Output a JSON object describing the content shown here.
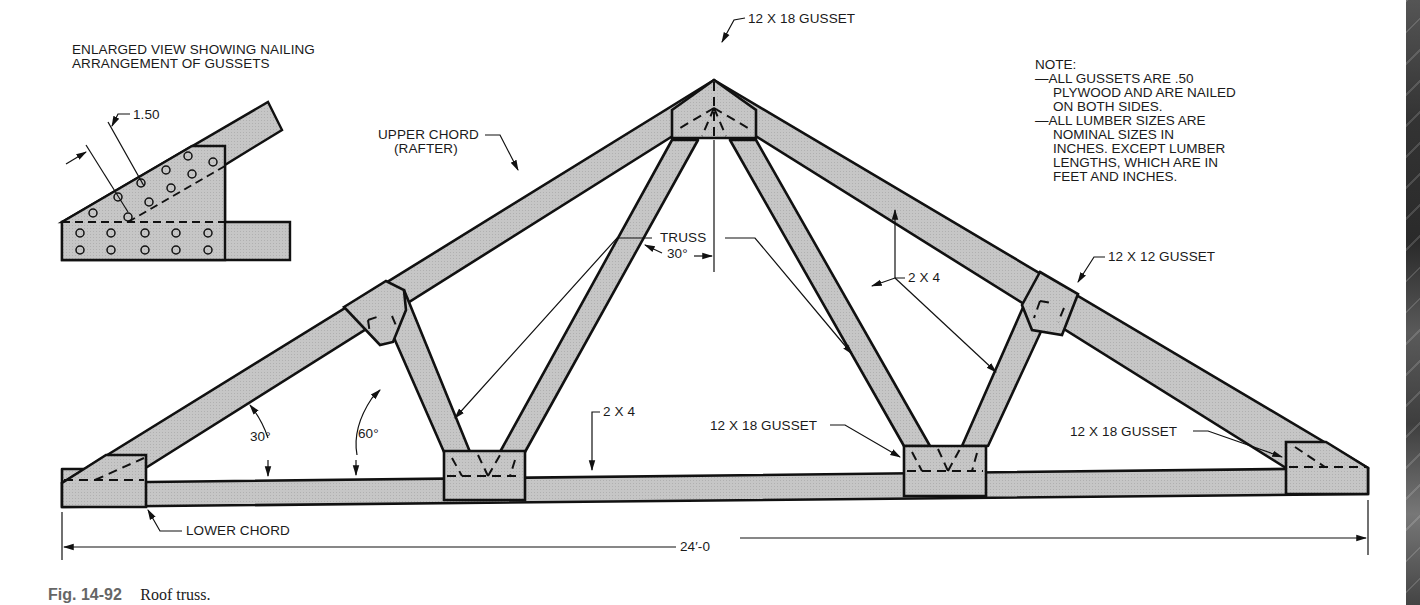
{
  "figure": {
    "number": "Fig. 14-92",
    "title": "Roof truss."
  },
  "enlarged_view": {
    "title_line1": "ENLARGED VIEW SHOWING NAILING",
    "title_line2": "ARRANGEMENT OF GUSSETS",
    "dimension": "1.50"
  },
  "labels": {
    "peak_gusset": "12 X 18 GUSSET",
    "upper_chord_line1": "UPPER CHORD",
    "upper_chord_line2": "(RAFTER)",
    "right_web_gusset": "12 X 12 GUSSET",
    "web_angle_30": "30°",
    "web_size": "2 X 4",
    "truss": "TRUSS",
    "lower_chord_size": "2 X 4",
    "heel_angle_30": "30°",
    "web_angle_60": "60°",
    "center_right_gusset": "12 X 18 GUSSET",
    "right_heel_gusset": "12 X 18 GUSSET",
    "lower_chord": "LOWER CHORD",
    "span": "24′-0"
  },
  "note": {
    "heading": "NOTE:",
    "lines": [
      "—ALL GUSSETS ARE .50",
      "PLYWOOD AND ARE NAILED",
      "ON BOTH SIDES.",
      "—ALL LUMBER SIZES ARE",
      "NOMINAL SIZES IN",
      "INCHES. EXCEPT LUMBER",
      "LENGTHS, WHICH ARE IN",
      "FEET AND INCHES."
    ]
  },
  "colors": {
    "member_fill": "#c4c4c4",
    "outline": "#111111",
    "text": "#1a1a1a",
    "caption_number": "#666666"
  }
}
